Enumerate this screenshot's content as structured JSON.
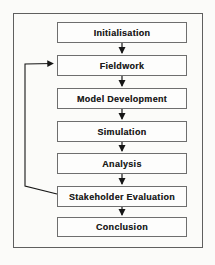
{
  "diagram": {
    "type": "flowchart",
    "steps": [
      {
        "label": "Initialisation"
      },
      {
        "label": "Fieldwork"
      },
      {
        "label": "Model Development"
      },
      {
        "label": "Simulation"
      },
      {
        "label": "Analysis"
      },
      {
        "label": "Stakeholder Evaluation"
      },
      {
        "label": "Conclusion"
      }
    ],
    "connections": [
      {
        "from": "Initialisation",
        "to": "Fieldwork",
        "style": "arrow-down"
      },
      {
        "from": "Fieldwork",
        "to": "Model Development",
        "style": "arrow-down"
      },
      {
        "from": "Model Development",
        "to": "Simulation",
        "style": "arrow-down"
      },
      {
        "from": "Simulation",
        "to": "Analysis",
        "style": "arrow-down"
      },
      {
        "from": "Analysis",
        "to": "Stakeholder Evaluation",
        "style": "arrow-down"
      },
      {
        "from": "Stakeholder Evaluation",
        "to": "Conclusion",
        "style": "arrow-down"
      },
      {
        "from": "Stakeholder Evaluation",
        "to": "Fieldwork",
        "style": "feedback-loop-left"
      }
    ],
    "colors": {
      "box_border": "#6e6e6e",
      "outer_border": "#5f5f5f",
      "arrow": "#161616",
      "text": "#1c1c1c",
      "background": "#fbfbf9"
    }
  }
}
